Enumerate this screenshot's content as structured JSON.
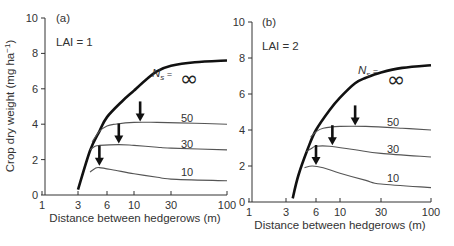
{
  "chart_data": [
    {
      "type": "line",
      "panel": "(a)",
      "annotation": "LAI = 1",
      "xlabel": "Distance between hedgerows (m)",
      "ylabel": "Crop dry weight (mg ha⁻¹)",
      "xscale": "log",
      "xticks": [
        1,
        3,
        6,
        10,
        30,
        100
      ],
      "yticks": [
        0,
        2,
        4,
        6,
        8,
        10
      ],
      "xlim": [
        1,
        100
      ],
      "ylim": [
        0,
        10
      ],
      "grid": false,
      "series_label_prefix": "Ns =",
      "series": [
        {
          "name": "∞",
          "style": "thick",
          "x": [
            3,
            4,
            5,
            6,
            8,
            10,
            15,
            20,
            30,
            50,
            100
          ],
          "y": [
            0.3,
            2.5,
            3.6,
            4.4,
            5.3,
            5.9,
            6.6,
            7.0,
            7.3,
            7.5,
            7.6
          ]
        },
        {
          "name": "50",
          "x": [
            4.2,
            5,
            6,
            7,
            10,
            20,
            50,
            100
          ],
          "y": [
            3.0,
            3.6,
            3.9,
            4.0,
            4.1,
            4.1,
            4.05,
            4.0
          ]
        },
        {
          "name": "30",
          "x": [
            4,
            4.5,
            5,
            7.5,
            10,
            20,
            30,
            100
          ],
          "y": [
            2.55,
            2.75,
            2.8,
            2.85,
            2.8,
            2.7,
            2.65,
            2.55
          ]
        },
        {
          "name": "10",
          "x": [
            4,
            4.5,
            5,
            7,
            10,
            20,
            30,
            100
          ],
          "y": [
            1.3,
            1.5,
            1.55,
            1.4,
            1.2,
            1.0,
            0.9,
            0.8
          ]
        }
      ],
      "arrows": [
        {
          "series": "10",
          "x": 5,
          "y": 1.6
        },
        {
          "series": "30",
          "x": 7.5,
          "y": 2.85
        },
        {
          "series": "50",
          "x": 12,
          "y": 4.1
        }
      ]
    },
    {
      "type": "line",
      "panel": "(b)",
      "annotation": "LAI = 2",
      "xlabel": "Distance between hedgerows (m)",
      "ylabel": "Crop dry weight (mg ha⁻¹)",
      "xscale": "log",
      "xticks": [
        1,
        3,
        6,
        10,
        30,
        100
      ],
      "yticks": [
        0,
        2,
        4,
        6,
        8,
        10
      ],
      "xlim": [
        1,
        100
      ],
      "ylim": [
        0,
        10
      ],
      "grid": false,
      "series_label_prefix": "Ns =",
      "series": [
        {
          "name": "∞",
          "style": "thick",
          "x": [
            3.5,
            4,
            5,
            6,
            8,
            10,
            15,
            20,
            30,
            50,
            100
          ],
          "y": [
            0.2,
            1.5,
            3.0,
            4.0,
            5.1,
            5.8,
            6.6,
            6.9,
            7.2,
            7.45,
            7.6
          ]
        },
        {
          "name": "50",
          "x": [
            5.3,
            6,
            7,
            10,
            20,
            50,
            100
          ],
          "y": [
            3.6,
            3.9,
            4.1,
            4.2,
            4.2,
            4.1,
            4.0
          ]
        },
        {
          "name": "30",
          "x": [
            4.8,
            5.5,
            6,
            8,
            15,
            30,
            100
          ],
          "y": [
            2.8,
            3.0,
            3.1,
            3.1,
            2.9,
            2.7,
            2.5
          ]
        },
        {
          "name": "10",
          "x": [
            4.6,
            5.5,
            7,
            10,
            20,
            30,
            100
          ],
          "y": [
            1.9,
            2.0,
            1.9,
            1.6,
            1.2,
            1.0,
            0.8
          ]
        }
      ],
      "arrows": [
        {
          "series": "10",
          "x": 6,
          "y": 2.0
        },
        {
          "series": "30",
          "x": 8.5,
          "y": 3.1
        },
        {
          "series": "50",
          "x": 15,
          "y": 4.2
        }
      ]
    }
  ],
  "labels": {
    "panel_a": "(a)",
    "panel_b": "(b)",
    "lai_a": "LAI = 1",
    "lai_b": "LAI = 2",
    "xlabel": "Distance between hedgerows (m)",
    "ylabel_main": "Crop dry weight (mg ha",
    "ylabel_sup": "−1",
    "ylabel_end": ")",
    "ns": "N",
    "ns_sub": "s",
    "ns_eq": " =",
    "infinity": "∞",
    "s50": "50",
    "s30": "30",
    "s10": "10"
  },
  "ticks": {
    "x": [
      "1",
      "3",
      "6",
      "10",
      "30",
      "100"
    ],
    "y": [
      "0",
      "2",
      "4",
      "6",
      "8",
      "10"
    ]
  }
}
